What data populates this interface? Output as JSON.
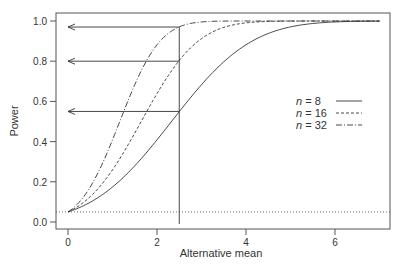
{
  "chart_data": {
    "type": "line",
    "title": "",
    "xlabel": "Alternative mean",
    "ylabel": "Power",
    "xlim": [
      -0.3,
      7.4
    ],
    "ylim": [
      -0.035,
      1.04
    ],
    "x_ticks": [
      0,
      2,
      4,
      6
    ],
    "x_tick_labels": [
      "0",
      "2",
      "4",
      "6"
    ],
    "y_ticks": [
      0.0,
      0.2,
      0.4,
      0.6,
      0.8,
      1.0
    ],
    "y_tick_labels": [
      "0.0",
      "0.2",
      "0.4",
      "0.6",
      "0.8",
      "1.0"
    ],
    "grid": false,
    "legend_position": "right-middle",
    "model": {
      "description": "one-sided z-test power, alpha = 0.05, sigma = 4",
      "z_alpha": 1.645,
      "sigma": 4,
      "x_range": [
        0,
        7
      ]
    },
    "series": [
      {
        "name": "n = 8",
        "n": 8,
        "style": "solid",
        "x": [
          0,
          1,
          2,
          2.5,
          3,
          4,
          5,
          6,
          7
        ],
        "values": [
          0.05,
          0.15,
          0.36,
          0.55,
          0.64,
          0.87,
          0.97,
          0.996,
          1.0
        ]
      },
      {
        "name": "n = 16",
        "n": 16,
        "style": "dashed",
        "x": [
          0,
          1,
          2,
          2.5,
          3,
          4,
          5,
          6,
          7
        ],
        "values": [
          0.05,
          0.26,
          0.64,
          0.8,
          0.91,
          0.99,
          1.0,
          1.0,
          1.0
        ]
      },
      {
        "name": "n = 32",
        "n": 32,
        "style": "dashdot",
        "x": [
          0,
          1,
          2,
          2.5,
          3,
          4,
          5,
          6,
          7
        ],
        "values": [
          0.05,
          0.45,
          0.91,
          0.97,
          0.99,
          1.0,
          1.0,
          1.0,
          1.0
        ]
      }
    ],
    "reference_lines": [
      {
        "type": "horizontal",
        "y": 0.05,
        "style": "dotted",
        "label": "alpha"
      },
      {
        "type": "vertical",
        "x": 2.5,
        "style": "solid"
      }
    ],
    "arrows": [
      {
        "from_x": 2.5,
        "to_x": 0,
        "y": 0.97,
        "series": "n = 32"
      },
      {
        "from_x": 2.5,
        "to_x": 0,
        "y": 0.8,
        "series": "n = 16"
      },
      {
        "from_x": 2.5,
        "to_x": 0,
        "y": 0.55,
        "series": "n = 8"
      }
    ]
  },
  "legend": {
    "entries": [
      {
        "prefix": "n",
        "suffix": " = 8",
        "style": "solid"
      },
      {
        "prefix": "n",
        "suffix": " = 16",
        "style": "dashed"
      },
      {
        "prefix": "n",
        "suffix": " = 32",
        "style": "dashdot"
      }
    ]
  },
  "axes": {
    "xlabel": "Alternative mean",
    "ylabel": "Power",
    "x_tick_labels": [
      "0",
      "2",
      "4",
      "6"
    ],
    "y_tick_labels": [
      "0.0",
      "0.2",
      "0.4",
      "0.6",
      "0.8",
      "1.0"
    ]
  }
}
